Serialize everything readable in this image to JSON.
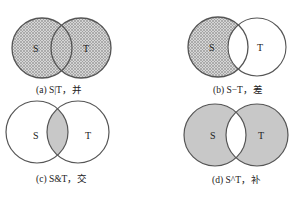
{
  "figure": {
    "panels": [
      {
        "id": "a",
        "caption": "(a) S|T，并",
        "operation": "union",
        "shaded": [
          "S",
          "T"
        ],
        "fill_style": "crosshatch",
        "labels": {
          "left": "S",
          "right": "T"
        }
      },
      {
        "id": "b",
        "caption": "(b) S−T，差",
        "operation": "difference",
        "shaded": [
          "S-only"
        ],
        "fill_style": "crosshatch",
        "labels": {
          "left": "S",
          "right": "T"
        }
      },
      {
        "id": "c",
        "caption": "(c) S&T，交",
        "operation": "intersection",
        "shaded": [
          "S∩T"
        ],
        "fill_style": "solid",
        "labels": {
          "left": "S",
          "right": "T"
        }
      },
      {
        "id": "d",
        "caption": "(d) S^T，补",
        "operation": "symmetric-difference",
        "shaded": [
          "S-only",
          "T-only"
        ],
        "fill_style": "solid",
        "labels": {
          "left": "S",
          "right": "T"
        }
      }
    ]
  },
  "colors": {
    "outline": "#555555",
    "fill_gray": "#c8c8c8",
    "hatch_dark": "#9a9a9a",
    "hatch_light": "#d6d6d6",
    "text": "#222222"
  }
}
